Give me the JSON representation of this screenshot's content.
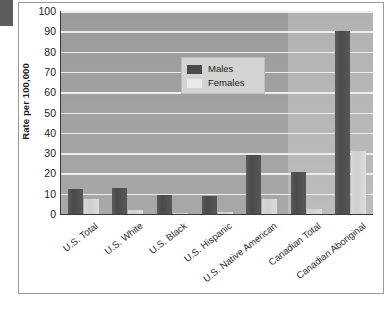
{
  "chart_data": {
    "type": "bar",
    "title": "",
    "xlabel": "",
    "ylabel": "Rate per 100,000",
    "ylim": [
      0,
      100
    ],
    "ytick_step": 10,
    "yticks": [
      100,
      90,
      80,
      70,
      60,
      50,
      40,
      30,
      20,
      10,
      0
    ],
    "grid": true,
    "legend_position": "upper-left-inside",
    "categories": [
      "U.S. Total",
      "U.S. White",
      "U.S. Black",
      "U.S. Hispanic",
      "U.S. Native American",
      "Canadian Total",
      "Canadian Aboriginal"
    ],
    "series": [
      {
        "name": "Males",
        "color": "#4a4a4a",
        "values": [
          12.5,
          13,
          9.5,
          9,
          29,
          20.5,
          90
        ]
      },
      {
        "name": "Females",
        "color": "#d8d8d6",
        "values": [
          7.5,
          2,
          0.5,
          1,
          7.5,
          2.5,
          31
        ]
      }
    ]
  },
  "legend": {
    "items": [
      {
        "label": "Males"
      },
      {
        "label": "Females"
      }
    ]
  },
  "colors": {
    "plot_background": "#9b9b9b",
    "canada_band": "#b2b2b2",
    "gridline": "#ececeb",
    "axis": "#3a3a3a",
    "male_bar": "#4a4a4a",
    "female_bar": "#d8d8d6",
    "frame": "#9a9a9a",
    "text": "#1b1b1b"
  }
}
